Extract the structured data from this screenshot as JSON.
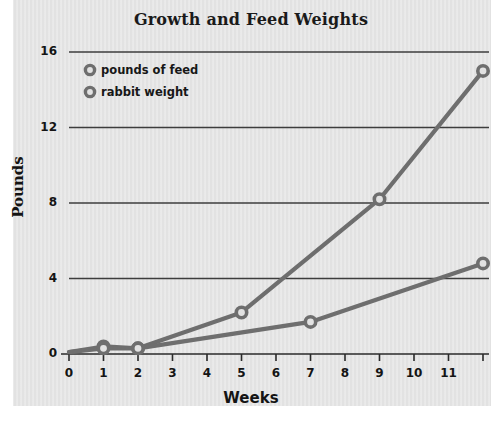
{
  "chart_data": {
    "type": "line",
    "title": "Growth and Feed Weights",
    "xlabel": "Weeks",
    "ylabel": "Pounds",
    "xlim": [
      0,
      12
    ],
    "ylim": [
      0,
      16
    ],
    "grid": true,
    "grid_axis": "y",
    "legend_position": "top-left",
    "x_ticks": [
      0,
      1,
      2,
      3,
      4,
      5,
      6,
      7,
      8,
      9,
      10,
      11
    ],
    "x_tick_labels": [
      "0",
      "1",
      "2",
      "3",
      "4",
      "5",
      "6",
      "7",
      "8",
      "9",
      "10",
      "11"
    ],
    "y_ticks": [
      0,
      4,
      8,
      12,
      16
    ],
    "y_tick_labels": [
      "0",
      "4",
      "8",
      "12",
      "16"
    ],
    "series": [
      {
        "name": "pounds of feed",
        "color": "#6e6e6e",
        "marker": "circle-open",
        "points": [
          {
            "x": 0,
            "y": 0.1
          },
          {
            "x": 1,
            "y": 0.4
          },
          {
            "x": 2,
            "y": 0.3
          },
          {
            "x": 5,
            "y": 2.2
          },
          {
            "x": 9,
            "y": 8.2
          },
          {
            "x": 12,
            "y": 15.0
          }
        ]
      },
      {
        "name": "rabbit weight",
        "color": "#6e6e6e",
        "marker": "circle-open",
        "points": [
          {
            "x": 0,
            "y": 0.1
          },
          {
            "x": 1,
            "y": 0.3
          },
          {
            "x": 2,
            "y": 0.3
          },
          {
            "x": 7,
            "y": 1.7
          },
          {
            "x": 12,
            "y": 4.8
          }
        ]
      }
    ]
  },
  "legend": {
    "items": [
      {
        "label": "pounds of feed"
      },
      {
        "label": "rabbit weight"
      }
    ]
  },
  "colors": {
    "panel_background": "#e2e2e2",
    "page_background": "#ffffff",
    "series_gray": "#6e6e6e",
    "gridline": "#3d3d3d",
    "axis": "#2a2a2a",
    "text": "#141414"
  }
}
